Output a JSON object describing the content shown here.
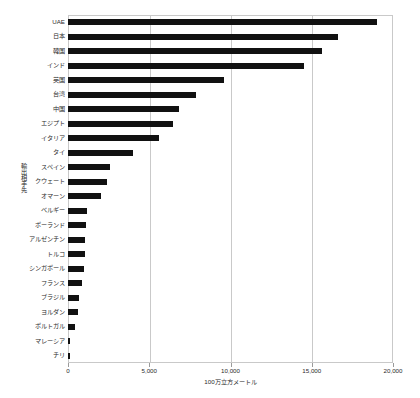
{
  "chart_data": {
    "type": "bar",
    "orientation": "horizontal",
    "title": "",
    "subtitle": "",
    "xlabel": "100万立方メートル",
    "ylabel": "輸出相手先",
    "xlim": [
      0,
      20000
    ],
    "xticks": [
      0,
      5000,
      10000,
      15000,
      20000
    ],
    "xtick_labels": [
      "0",
      "5,000",
      "10,000",
      "15,000",
      "20,000"
    ],
    "grid": true,
    "grid_axis": "x",
    "legend": false,
    "legend_position": "none",
    "bar_color": "#111111",
    "categories": [
      "UAE",
      "日本",
      "韓国",
      "インド",
      "英国",
      "台湾",
      "中国",
      "エジプト",
      "イタリア",
      "タイ",
      "スペイン",
      "クウェート",
      "オマーン",
      "ベルギー",
      "ポーランド",
      "アルゼンチン",
      "トルコ",
      "シンガポール",
      "フランス",
      "ブラジル",
      "ヨルダン",
      "ポルトガル",
      "マレーシア",
      "チリ"
    ],
    "values": [
      19000,
      16600,
      15600,
      14500,
      9600,
      7850,
      6800,
      6450,
      5600,
      4000,
      2600,
      2400,
      2000,
      1150,
      1100,
      1050,
      1020,
      980,
      880,
      700,
      620,
      450,
      120,
      100
    ],
    "annotations": []
  },
  "axis": {
    "y_title": "輸出相手先",
    "x_title": "100万立方メートル"
  }
}
